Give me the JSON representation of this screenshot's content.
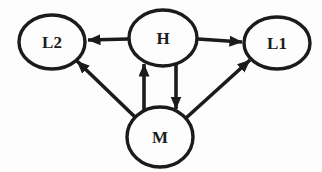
{
  "diagram": {
    "background_color": "#fdfdfd",
    "ink_color": "#1b1b1b",
    "node_stroke_width": 3.4,
    "edge_stroke_width": 3.6,
    "nodes": [
      {
        "id": "L2",
        "label": "L2",
        "cx": 52,
        "cy": 42,
        "rx": 33,
        "ry": 27
      },
      {
        "id": "H",
        "label": "H",
        "cx": 163,
        "cy": 38,
        "rx": 34,
        "ry": 28
      },
      {
        "id": "L1",
        "label": "L1",
        "cx": 277,
        "cy": 43,
        "rx": 33,
        "ry": 26
      },
      {
        "id": "M",
        "label": "M",
        "cx": 160,
        "cy": 137,
        "rx": 33,
        "ry": 30
      }
    ],
    "edges": [
      {
        "from": "H",
        "to": "L2",
        "x1": 128,
        "y1": 39,
        "x2": 88,
        "y2": 40
      },
      {
        "from": "H",
        "to": "L1",
        "x1": 198,
        "y1": 39,
        "x2": 242,
        "y2": 42
      },
      {
        "from": "M",
        "to": "H",
        "x1": 144,
        "y1": 110,
        "x2": 144,
        "y2": 64
      },
      {
        "from": "H",
        "to": "M",
        "x1": 176,
        "y1": 65,
        "x2": 176,
        "y2": 109
      },
      {
        "from": "M",
        "to": "L2",
        "x1": 135,
        "y1": 117,
        "x2": 77,
        "y2": 61
      },
      {
        "from": "M",
        "to": "L1",
        "x1": 186,
        "y1": 118,
        "x2": 250,
        "y2": 60
      }
    ]
  }
}
